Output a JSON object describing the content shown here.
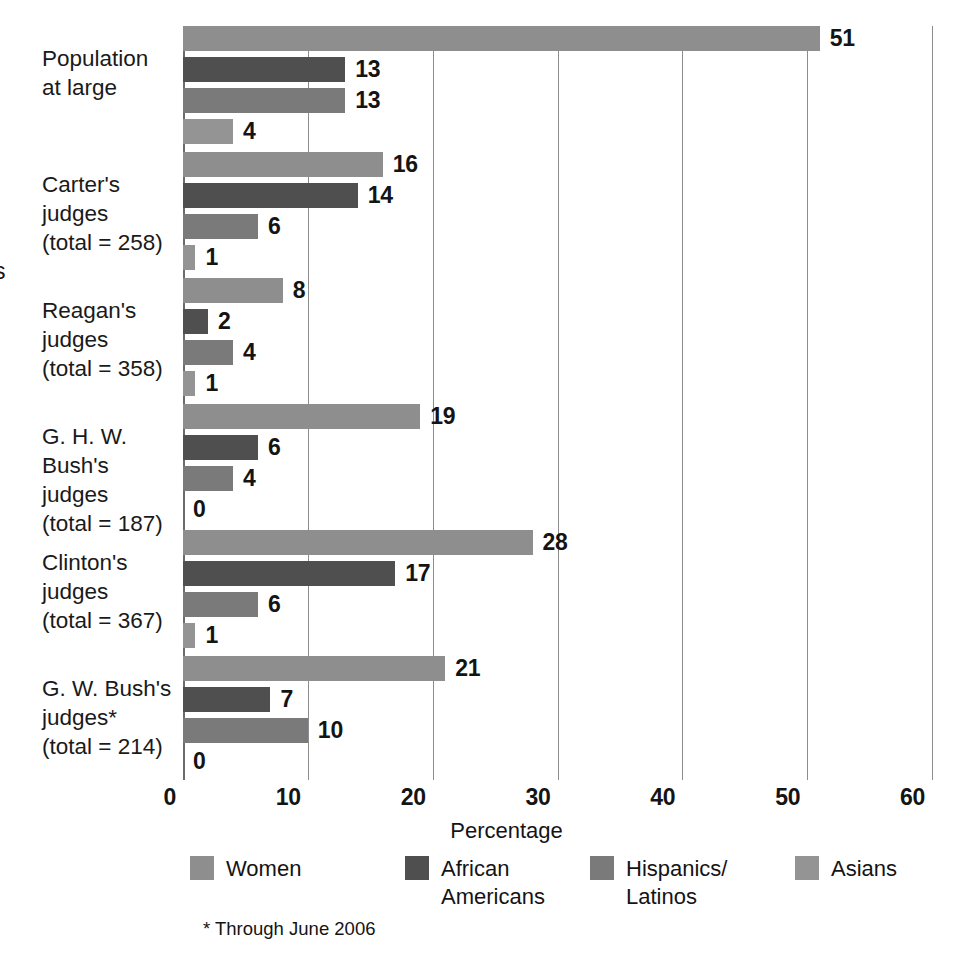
{
  "chart_data": {
    "type": "bar",
    "orientation": "horizontal",
    "title": "",
    "xlabel": "Percentage",
    "ylabel": "",
    "xlim": [
      0,
      60
    ],
    "xticks": [
      0,
      10,
      20,
      30,
      40,
      50,
      60
    ],
    "grid": true,
    "legend_position": "bottom",
    "categories": [
      "Population\nat large",
      "Carter's judges\n(total = 258)",
      "Reagan's judges\n(total = 358)",
      "G. H. W. Bush's\njudges\n(total = 187)",
      "Clinton's judges\n(total = 367)",
      "G. W. Bush's\njudges*\n(total = 214)"
    ],
    "series": [
      {
        "name": "Women",
        "color": "#8e8e8e",
        "values": [
          51,
          16,
          8,
          19,
          28,
          21
        ]
      },
      {
        "name": "African\nAmericans",
        "color": "#4f4f4f",
        "values": [
          13,
          14,
          2,
          6,
          17,
          7
        ]
      },
      {
        "name": "Hispanics/\nLatinos",
        "color": "#7a7a7a",
        "values": [
          13,
          6,
          4,
          4,
          6,
          10
        ]
      },
      {
        "name": "Asians",
        "color": "#949494",
        "values": [
          4,
          1,
          1,
          0,
          1,
          0
        ]
      }
    ],
    "footnote": "* Through June 2006",
    "edge_fragment": "s"
  }
}
